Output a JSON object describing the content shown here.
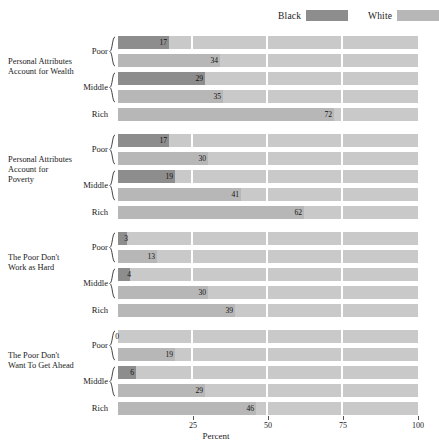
{
  "legend": {
    "items": [
      {
        "label": "Black",
        "color": "#8d8d8d",
        "left": 278
      },
      {
        "label": "White",
        "color": "#b7b7b7",
        "left": 368
      }
    ]
  },
  "axis": {
    "xlabel": "Percent",
    "ticks": [
      "25",
      "50",
      "75",
      "100"
    ],
    "tick_values": [
      25,
      50,
      75,
      100
    ],
    "range": [
      0,
      100
    ],
    "group_labels": [
      "Poor",
      "Middle",
      "Rich"
    ]
  },
  "colors": {
    "black_series": "#8d8d8d",
    "white_series": "#b7b7b7",
    "track": "#c9c9c9",
    "background": "#ffffff",
    "text": "#1a1a1a"
  },
  "chart_data": {
    "type": "bar",
    "title": "",
    "xlabel": "Percent",
    "ylabel": "",
    "xlim": [
      0,
      100
    ],
    "grid": false,
    "legend_position": "top-right",
    "legend": [
      "Black",
      "White"
    ],
    "categories": [
      "Poor",
      "Middle",
      "Rich"
    ],
    "panels": [
      {
        "name": "Personal Attributes Account for Wealth",
        "bars": [
          {
            "group": "Poor",
            "series": "Black",
            "value": 17
          },
          {
            "group": "Poor",
            "series": "White",
            "value": 34
          },
          {
            "group": "Middle",
            "series": "Black",
            "value": 29
          },
          {
            "group": "Middle",
            "series": "White",
            "value": 35
          },
          {
            "group": "Rich",
            "series": "White",
            "value": 72
          }
        ]
      },
      {
        "name": "Personal Attributes Account for Poverty",
        "bars": [
          {
            "group": "Poor",
            "series": "Black",
            "value": 17
          },
          {
            "group": "Poor",
            "series": "White",
            "value": 30
          },
          {
            "group": "Middle",
            "series": "Black",
            "value": 19
          },
          {
            "group": "Middle",
            "series": "White",
            "value": 41
          },
          {
            "group": "Rich",
            "series": "White",
            "value": 62
          }
        ]
      },
      {
        "name": "The Poor Don't Work as Hard",
        "bars": [
          {
            "group": "Poor",
            "series": "Black",
            "value": 3
          },
          {
            "group": "Poor",
            "series": "White",
            "value": 13
          },
          {
            "group": "Middle",
            "series": "Black",
            "value": 4
          },
          {
            "group": "Middle",
            "series": "White",
            "value": 30
          },
          {
            "group": "Rich",
            "series": "White",
            "value": 39
          }
        ]
      },
      {
        "name": "The Poor Don't Want To Get Ahead",
        "bars": [
          {
            "group": "Poor",
            "series": "Black",
            "value": 0
          },
          {
            "group": "Poor",
            "series": "White",
            "value": 19
          },
          {
            "group": "Middle",
            "series": "Black",
            "value": 6
          },
          {
            "group": "Middle",
            "series": "White",
            "value": 29
          },
          {
            "group": "Rich",
            "series": "White",
            "value": 46
          }
        ]
      }
    ]
  }
}
